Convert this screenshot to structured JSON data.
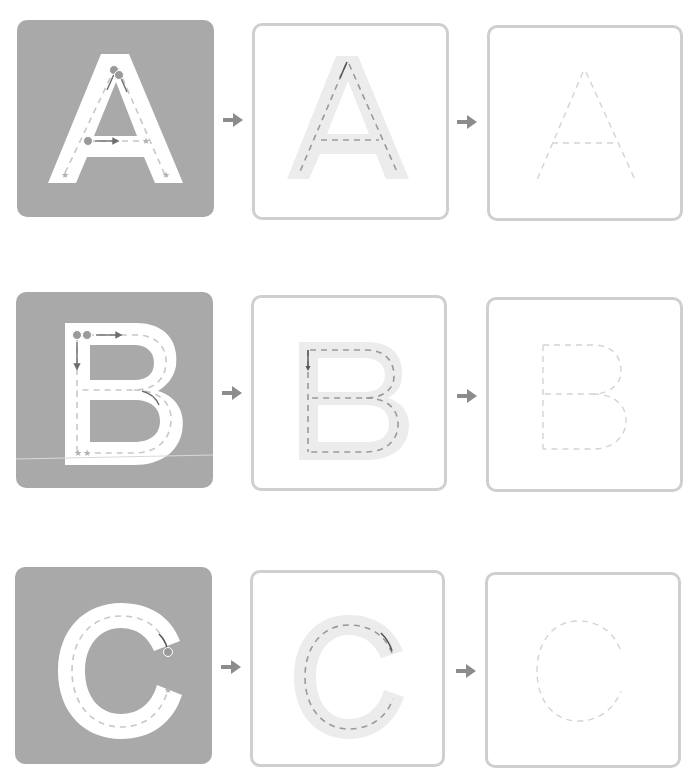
{
  "worksheet": {
    "rows": [
      {
        "letter": "A",
        "steps": [
          {
            "type": "model",
            "description": "Solid letter A with stroke-order markers 1 and 2 and star end points"
          },
          {
            "type": "guided-trace",
            "description": "Light gray letter A with dashed centerline"
          },
          {
            "type": "free-trace",
            "description": "Dashed outline of letter A"
          }
        ]
      },
      {
        "letter": "B",
        "steps": [
          {
            "type": "model",
            "description": "Solid letter B with stroke-order markers 1 and 2 and star end points"
          },
          {
            "type": "guided-trace",
            "description": "Light gray letter B with dashed centerline"
          },
          {
            "type": "free-trace",
            "description": "Dashed outline of letter B"
          }
        ]
      },
      {
        "letter": "C",
        "steps": [
          {
            "type": "model",
            "description": "Solid letter C with start marker and star end point"
          },
          {
            "type": "guided-trace",
            "description": "Light gray letter C with dashed centerline"
          },
          {
            "type": "free-trace",
            "description": "Dashed outline of letter C"
          }
        ]
      }
    ],
    "markers": {
      "start_1": "1",
      "start_2": "2",
      "end": "★"
    }
  },
  "colors": {
    "model_bg": "#a9a9a9",
    "letter_fill": "#ffffff",
    "guide_fill": "#ececec",
    "dash_dark": "#9a9a9a",
    "dash_light": "#d4d4d4",
    "card_border": "#cfcfcf",
    "arrow": "#8c8c8c",
    "direction_arrow": "#6e6e6e"
  },
  "icons": {
    "step_arrow": "right-arrow-icon",
    "start_marker": "numbered-circle-icon",
    "end_marker": "star-icon"
  }
}
